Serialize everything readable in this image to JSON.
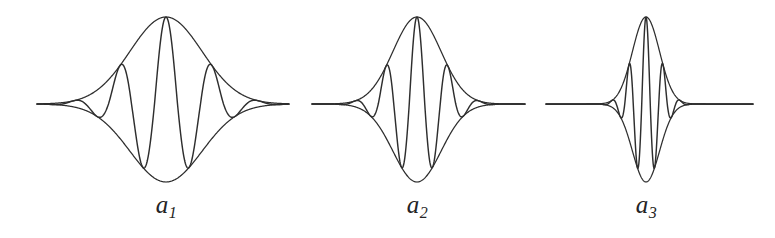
{
  "figure": {
    "background_color": "#ffffff",
    "stroke_color": "#2e2e2e",
    "width": 775,
    "height": 238,
    "baseline_y": 104
  },
  "panels": [
    {
      "label_base": "a",
      "label_sub": "1",
      "label_x": 166,
      "label_y": 192,
      "center_x": 166,
      "scale": 1.0
    },
    {
      "label_base": "a",
      "label_sub": "2",
      "label_x": 417,
      "label_y": 192,
      "center_x": 417,
      "scale": 0.66
    },
    {
      "label_base": "a",
      "label_sub": "3",
      "label_x": 646,
      "label_y": 192,
      "center_x": 646,
      "scale": 0.37
    }
  ],
  "chart_data": {
    "type": "line",
    "xlabel": "",
    "ylabel": "",
    "grid": false,
    "legend": "none",
    "axis_ranges": {
      "x": [
        0,
        775
      ],
      "y": [
        17,
        182
      ]
    },
    "annotations": [
      "a1",
      "a2",
      "a3"
    ],
    "common": {
      "baseline_y": 104,
      "peak_y": 17,
      "trough_y": 182,
      "amplitude_up": 87,
      "amplitude_down": 78,
      "oscillation_cycles": 3.5,
      "envelope": "gaussian"
    },
    "series": [
      {
        "name": "a1",
        "center_x": 166,
        "line_start_x": 37,
        "line_end_x": 289,
        "envelope_sigma": 36,
        "carrier_wavelength": 46,
        "zero_crossings_x": [
          97,
          120,
          143,
          166,
          189,
          212,
          235
        ],
        "lobe_peaks": [
          {
            "x": 166,
            "y": 17,
            "kind": "positive-main"
          },
          {
            "x": 143,
            "y": 182,
            "kind": "negative-main"
          },
          {
            "x": 189,
            "y": 182,
            "kind": "negative-main"
          },
          {
            "x": 120,
            "y": 62,
            "kind": "positive-side"
          },
          {
            "x": 212,
            "y": 62,
            "kind": "positive-side"
          },
          {
            "x": 97,
            "y": 122,
            "kind": "negative-side"
          },
          {
            "x": 235,
            "y": 122,
            "kind": "negative-side"
          }
        ]
      },
      {
        "name": "a2",
        "center_x": 417,
        "line_start_x": 312,
        "line_end_x": 525,
        "envelope_sigma": 24,
        "carrier_wavelength": 31,
        "zero_crossings_x": [
          371,
          386,
          402,
          417,
          432,
          448,
          463
        ],
        "lobe_peaks": [
          {
            "x": 417,
            "y": 17,
            "kind": "positive-main"
          },
          {
            "x": 402,
            "y": 182,
            "kind": "negative-main"
          },
          {
            "x": 432,
            "y": 182,
            "kind": "negative-main"
          },
          {
            "x": 386,
            "y": 62,
            "kind": "positive-side"
          },
          {
            "x": 448,
            "y": 62,
            "kind": "positive-side"
          },
          {
            "x": 371,
            "y": 122,
            "kind": "negative-side"
          },
          {
            "x": 463,
            "y": 122,
            "kind": "negative-side"
          }
        ]
      },
      {
        "name": "a3",
        "center_x": 646,
        "line_start_x": 546,
        "line_end_x": 753,
        "envelope_sigma": 13.5,
        "carrier_wavelength": 17,
        "zero_crossings_x": [
          616,
          626,
          636,
          646,
          656,
          666,
          676
        ],
        "lobe_peaks": [
          {
            "x": 646,
            "y": 17,
            "kind": "positive-main"
          },
          {
            "x": 636,
            "y": 182,
            "kind": "negative-main"
          },
          {
            "x": 656,
            "y": 182,
            "kind": "negative-main"
          },
          {
            "x": 626,
            "y": 62,
            "kind": "positive-side"
          },
          {
            "x": 666,
            "y": 62,
            "kind": "positive-side"
          },
          {
            "x": 616,
            "y": 122,
            "kind": "negative-side"
          },
          {
            "x": 676,
            "y": 122,
            "kind": "negative-side"
          }
        ]
      }
    ]
  }
}
